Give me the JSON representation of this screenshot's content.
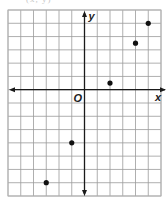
{
  "caption_fragment": "(x, y)",
  "chart_data": {
    "type": "scatter",
    "title": "",
    "xlabel": "x",
    "ylabel": "y",
    "origin_label": "O",
    "xlim": [
      -6,
      6
    ],
    "ylim": [
      -8,
      6
    ],
    "grid": true,
    "grid_step": 1,
    "tick_labels": false,
    "legend": null,
    "points": [
      {
        "x": -3,
        "y": -7
      },
      {
        "x": -1,
        "y": -4
      },
      {
        "x": 2,
        "y": 0.5
      },
      {
        "x": 4,
        "y": 3.5
      },
      {
        "x": 5,
        "y": 5
      }
    ],
    "x": [
      -3,
      -1,
      2,
      4,
      5
    ],
    "y": [
      -7,
      -4,
      0.5,
      3.5,
      5
    ]
  },
  "style": {
    "grid_color": "#9a9a9a",
    "axis_color": "#1a1a1a",
    "point_color": "#111111",
    "border_color": "#b5b5b5"
  },
  "layout": {
    "grid_left": 8,
    "grid_right": 161,
    "grid_top": 10,
    "grid_bottom": 196
  }
}
